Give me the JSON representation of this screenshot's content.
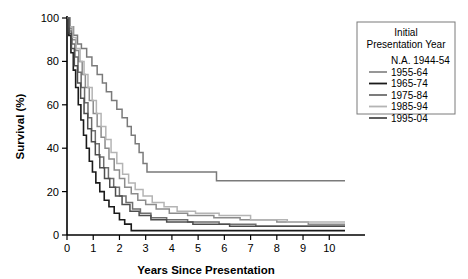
{
  "chart_data": {
    "type": "line",
    "title": "",
    "xlabel": "Years Since Presentation",
    "ylabel": "Survival (%)",
    "xlim": [
      0,
      10.6
    ],
    "ylim": [
      0,
      100
    ],
    "xticks": [
      0,
      1,
      2,
      3,
      4,
      5,
      6,
      7,
      8,
      9,
      10
    ],
    "yticks": [
      0,
      20,
      40,
      60,
      80,
      100
    ],
    "xticklabels": [
      "0",
      "1",
      "2",
      "3",
      "4",
      "5",
      "6",
      "7",
      "8",
      "9",
      "10"
    ],
    "yticklabels": [
      "0",
      "20",
      "40",
      "60",
      "80",
      "100"
    ],
    "grid": false,
    "step_type": "post",
    "legend": {
      "position": "top-right",
      "title_lines": [
        "Initial",
        "Presentation Year"
      ],
      "entries": [
        {
          "label": "N.A. 1944-54",
          "color": "#7a7a7a",
          "swatch": false
        },
        {
          "label": "1955-64",
          "color": "#8c8c8c",
          "swatch": true
        },
        {
          "label": "1965-74",
          "color": "#1a1a1a",
          "swatch": true
        },
        {
          "label": "1975-84",
          "color": "#6e6e6e",
          "swatch": true
        },
        {
          "label": "1985-94",
          "color": "#b4b4b4",
          "swatch": true
        },
        {
          "label": "1995-04",
          "color": "#4d4d4d",
          "swatch": true
        }
      ]
    },
    "series": [
      {
        "name": "N.A. 1944-54",
        "color": "#7a7a7a",
        "width": 1.5,
        "points": [
          [
            0,
            100
          ],
          [
            0.12,
            96
          ],
          [
            0.25,
            92
          ],
          [
            0.4,
            88
          ],
          [
            0.55,
            86
          ],
          [
            0.75,
            82
          ],
          [
            0.95,
            78
          ],
          [
            1.15,
            74
          ],
          [
            1.35,
            70
          ],
          [
            1.5,
            66
          ],
          [
            1.7,
            62
          ],
          [
            1.9,
            58
          ],
          [
            2.1,
            54
          ],
          [
            2.3,
            50
          ],
          [
            2.45,
            46
          ],
          [
            2.6,
            42
          ],
          [
            2.75,
            38
          ],
          [
            2.9,
            33
          ],
          [
            3.05,
            29
          ],
          [
            5.7,
            25
          ],
          [
            10.6,
            25
          ]
        ]
      },
      {
        "name": "1955-64",
        "color": "#8c8c8c",
        "width": 1.5,
        "points": [
          [
            0,
            100
          ],
          [
            0.1,
            95
          ],
          [
            0.2,
            90
          ],
          [
            0.33,
            85
          ],
          [
            0.45,
            80
          ],
          [
            0.58,
            74
          ],
          [
            0.7,
            68
          ],
          [
            0.85,
            62
          ],
          [
            1.0,
            56
          ],
          [
            1.15,
            50
          ],
          [
            1.3,
            45
          ],
          [
            1.45,
            40
          ],
          [
            1.6,
            35
          ],
          [
            1.8,
            30
          ],
          [
            2.0,
            26
          ],
          [
            2.2,
            22
          ],
          [
            2.45,
            19
          ],
          [
            2.7,
            16
          ],
          [
            3.0,
            14
          ],
          [
            3.4,
            12
          ],
          [
            3.9,
            10
          ],
          [
            4.6,
            9
          ],
          [
            5.6,
            8
          ],
          [
            6.6,
            7
          ],
          [
            8.0,
            6
          ],
          [
            9.2,
            5
          ],
          [
            10.6,
            5
          ]
        ]
      },
      {
        "name": "1965-74",
        "color": "#1a1a1a",
        "width": 1.6,
        "points": [
          [
            0,
            100
          ],
          [
            0.07,
            92
          ],
          [
            0.15,
            84
          ],
          [
            0.24,
            76
          ],
          [
            0.33,
            68
          ],
          [
            0.43,
            60
          ],
          [
            0.53,
            53
          ],
          [
            0.63,
            46
          ],
          [
            0.74,
            40
          ],
          [
            0.85,
            34
          ],
          [
            0.97,
            29
          ],
          [
            1.1,
            24
          ],
          [
            1.25,
            20
          ],
          [
            1.42,
            16
          ],
          [
            1.6,
            13
          ],
          [
            1.8,
            10
          ],
          [
            2.0,
            7
          ],
          [
            2.2,
            5
          ],
          [
            2.45,
            3
          ],
          [
            2.45,
            2
          ],
          [
            10.6,
            2
          ]
        ]
      },
      {
        "name": "1975-84",
        "color": "#6e6e6e",
        "width": 1.5,
        "points": [
          [
            0,
            100
          ],
          [
            0.09,
            94
          ],
          [
            0.19,
            88
          ],
          [
            0.3,
            82
          ],
          [
            0.42,
            75
          ],
          [
            0.54,
            68
          ],
          [
            0.67,
            61
          ],
          [
            0.8,
            54
          ],
          [
            0.94,
            48
          ],
          [
            1.08,
            42
          ],
          [
            1.23,
            36
          ],
          [
            1.4,
            31
          ],
          [
            1.58,
            26
          ],
          [
            1.78,
            22
          ],
          [
            2.0,
            18
          ],
          [
            2.25,
            15
          ],
          [
            2.5,
            12
          ],
          [
            2.8,
            10
          ],
          [
            3.2,
            8
          ],
          [
            3.8,
            7
          ],
          [
            4.6,
            6
          ],
          [
            5.8,
            5
          ],
          [
            7.2,
            4
          ],
          [
            10.6,
            4
          ]
        ]
      },
      {
        "name": "1985-94",
        "color": "#b4b4b4",
        "width": 1.5,
        "points": [
          [
            0,
            100
          ],
          [
            0.1,
            96
          ],
          [
            0.22,
            91
          ],
          [
            0.35,
            86
          ],
          [
            0.5,
            80
          ],
          [
            0.65,
            74
          ],
          [
            0.8,
            68
          ],
          [
            0.96,
            62
          ],
          [
            1.12,
            56
          ],
          [
            1.3,
            50
          ],
          [
            1.48,
            44
          ],
          [
            1.68,
            38
          ],
          [
            1.9,
            33
          ],
          [
            2.12,
            28
          ],
          [
            2.35,
            24
          ],
          [
            2.6,
            21
          ],
          [
            2.9,
            18
          ],
          [
            3.25,
            15
          ],
          [
            3.7,
            13
          ],
          [
            4.2,
            11
          ],
          [
            4.9,
            10
          ],
          [
            5.8,
            9
          ],
          [
            7.0,
            7
          ],
          [
            8.4,
            6
          ],
          [
            10.6,
            6
          ]
        ]
      },
      {
        "name": "1995-04",
        "color": "#4d4d4d",
        "width": 1.5,
        "points": [
          [
            0,
            100
          ],
          [
            0.08,
            93
          ],
          [
            0.17,
            86
          ],
          [
            0.28,
            78
          ],
          [
            0.4,
            70
          ],
          [
            0.52,
            63
          ],
          [
            0.65,
            56
          ],
          [
            0.79,
            49
          ],
          [
            0.93,
            43
          ],
          [
            1.08,
            37
          ],
          [
            1.25,
            31
          ],
          [
            1.43,
            26
          ],
          [
            1.63,
            22
          ],
          [
            1.85,
            18
          ],
          [
            2.1,
            14
          ],
          [
            2.4,
            11
          ],
          [
            2.75,
            9
          ],
          [
            3.2,
            7
          ],
          [
            3.8,
            6
          ],
          [
            4.8,
            5
          ],
          [
            6.2,
            4
          ],
          [
            10.6,
            4
          ]
        ]
      }
    ]
  }
}
